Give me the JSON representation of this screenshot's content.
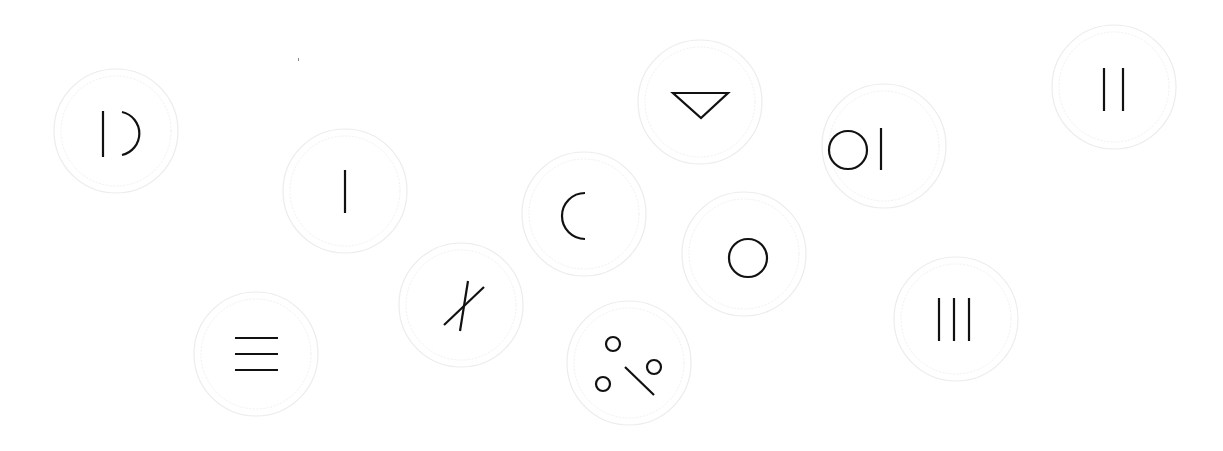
{
  "board": {
    "title": "",
    "tokens": [
      {
        "id": "t1",
        "glyph": "bar-arc",
        "description": "vertical bar and right half-circle"
      },
      {
        "id": "t2",
        "glyph": "single-bar",
        "description": "one vertical bar"
      },
      {
        "id": "t3",
        "glyph": "three-horizontal-bars",
        "description": "three horizontal bars"
      },
      {
        "id": "t4",
        "glyph": "crossed-lines",
        "description": "two crossed diagonal lines"
      },
      {
        "id": "t5",
        "glyph": "left-arc",
        "description": "left half-circle"
      },
      {
        "id": "t6",
        "glyph": "dots-and-slash",
        "description": "three small circles and a diagonal slash"
      },
      {
        "id": "t7",
        "glyph": "down-triangle",
        "description": "downward-pointing triangle"
      },
      {
        "id": "t8",
        "glyph": "circle",
        "description": "single circle"
      },
      {
        "id": "t9",
        "glyph": "circle-bar",
        "description": "circle followed by vertical bar"
      },
      {
        "id": "t10",
        "glyph": "three-vertical-bars",
        "description": "three vertical bars"
      },
      {
        "id": "t11",
        "glyph": "two-vertical-bars",
        "description": "two vertical bars"
      }
    ]
  }
}
